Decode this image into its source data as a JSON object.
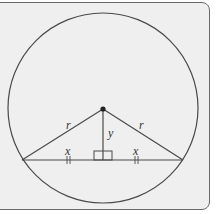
{
  "diagram": {
    "type": "geometry",
    "labels": {
      "radius_left": "r",
      "radius_right": "r",
      "height": "y",
      "half_chord_left": "x",
      "half_chord_right": "x"
    },
    "colors": {
      "background": "#efefef",
      "stroke": "#4a4a4a",
      "frame_border": "#6a6a6a"
    }
  }
}
